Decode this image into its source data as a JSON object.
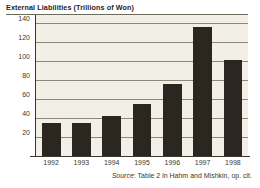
{
  "chart_data": {
    "type": "bar",
    "title": "External Liabilities (Trillions of Won)",
    "xlabel": "",
    "ylabel": "",
    "categories": [
      "1992",
      "1993",
      "1994",
      "1995",
      "1996",
      "1997",
      "1998"
    ],
    "values": [
      35,
      35,
      42,
      55,
      76,
      135,
      101
    ],
    "series": [
      {
        "name": "External Liabilities",
        "values": [
          35,
          35,
          42,
          55,
          76,
          135,
          101
        ]
      }
    ],
    "ylim": [
      0,
      148
    ],
    "yticks": [
      20,
      40,
      60,
      80,
      100,
      120,
      140
    ],
    "ytick_labels": [
      "20",
      "40",
      "60",
      "80",
      "100",
      "120",
      "140"
    ],
    "grid": true,
    "legend": false,
    "legend_position": "none",
    "units": "Trillions of Won",
    "colors": {
      "bar": "#2b2720",
      "plot_background": "#f2f0e6",
      "gridline": "#8d8878",
      "axis": "#3b382f",
      "text": "#27241c",
      "figure_background": "#ffffff"
    }
  },
  "source": {
    "label": "Source",
    "separator": ": ",
    "text": "Table 2 in Hahm and Mishkin, op. cit."
  }
}
